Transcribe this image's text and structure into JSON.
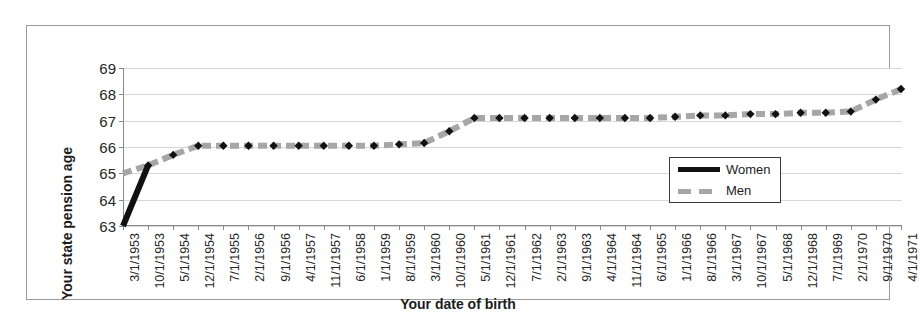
{
  "chart_data": {
    "type": "line",
    "title": "",
    "xlabel": "Your date of birth",
    "ylabel": "Your state pension age",
    "ylim": [
      63,
      69
    ],
    "yticks": [
      63,
      64,
      65,
      66,
      67,
      68,
      69
    ],
    "grid": true,
    "legend_position": "inside-right",
    "categories": [
      "3/1/1953",
      "10/1/1953",
      "5/1/1954",
      "12/1/1954",
      "7/1/1955",
      "2/1/1956",
      "9/1/1956",
      "4/1/1957",
      "11/1/1957",
      "6/1/1958",
      "1/1/1959",
      "8/1/1959",
      "3/1/1960",
      "10/1/1960",
      "5/1/1961",
      "12/1/1961",
      "7/1/1962",
      "2/1/1963",
      "9/1/1963",
      "4/1/1964",
      "11/1/1964",
      "6/1/1965",
      "1/1/1966",
      "8/1/1966",
      "3/1/1967",
      "10/1/1967",
      "5/1/1968",
      "12/1/1968",
      "7/1/1969",
      "2/1/1970",
      "9/1/1970",
      "4/1/1971"
    ],
    "series": [
      {
        "name": "Women",
        "color": "#111111",
        "style": "solid",
        "values": [
          63.0,
          65.3,
          65.7,
          66.05,
          66.05,
          66.05,
          66.05,
          66.05,
          66.05,
          66.05,
          66.05,
          66.1,
          66.15,
          66.6,
          67.1,
          67.1,
          67.1,
          67.1,
          67.1,
          67.1,
          67.1,
          67.1,
          67.15,
          67.2,
          67.2,
          67.25,
          67.25,
          67.3,
          67.3,
          67.35,
          67.8,
          68.2
        ]
      },
      {
        "name": "Men",
        "color": "#a6a6a6",
        "style": "dashed",
        "values": [
          65.0,
          65.3,
          65.7,
          66.05,
          66.05,
          66.05,
          66.05,
          66.05,
          66.05,
          66.05,
          66.05,
          66.1,
          66.15,
          66.6,
          67.1,
          67.1,
          67.1,
          67.1,
          67.1,
          67.1,
          67.1,
          67.1,
          67.15,
          67.2,
          67.2,
          67.25,
          67.25,
          67.3,
          67.3,
          67.35,
          67.8,
          68.2
        ]
      }
    ],
    "legend": [
      {
        "label": "Women",
        "color": "#111111",
        "style": "solid"
      },
      {
        "label": "Men",
        "color": "#a6a6a6",
        "style": "dashed"
      }
    ],
    "marker": "diamond",
    "marker_color": "#111111"
  }
}
